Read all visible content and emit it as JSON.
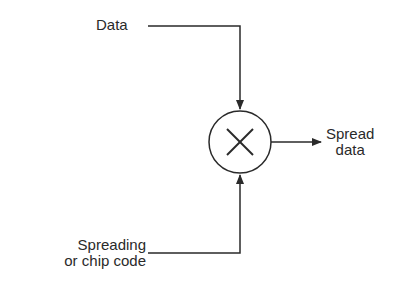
{
  "diagram": {
    "type": "block-diagram",
    "inputs": {
      "data": "Data",
      "code_line1": "Spreading",
      "code_line2": "or chip code"
    },
    "operator": {
      "symbol": "×",
      "name": "multiplier"
    },
    "output": {
      "line1": "Spread",
      "line2": "data"
    },
    "colors": {
      "stroke": "#2a2a2a",
      "background": "#ffffff"
    }
  }
}
